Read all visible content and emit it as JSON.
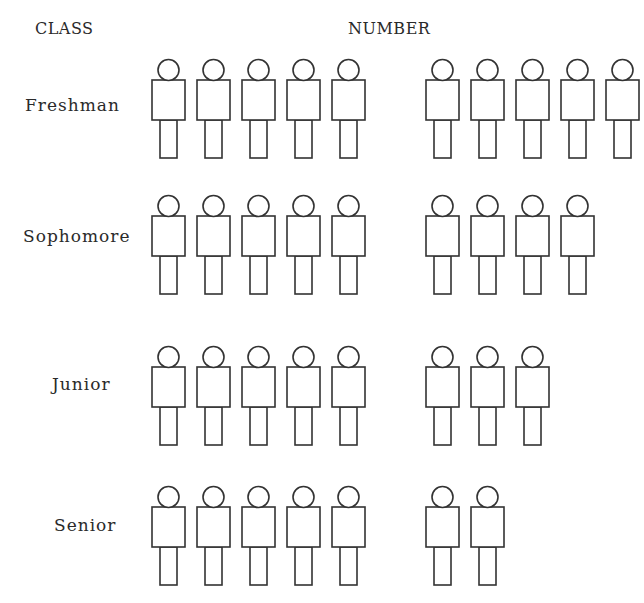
{
  "headers": {
    "class": "CLASS",
    "number": "NUMBER"
  },
  "rows": [
    {
      "label": "Freshman",
      "count": 10
    },
    {
      "label": "Sophomore",
      "count": 9
    },
    {
      "label": "Junior",
      "count": 8
    },
    {
      "label": "Senior",
      "count": 7
    }
  ],
  "chart_data": {
    "type": "pictograph",
    "title": "",
    "xlabel": "NUMBER",
    "ylabel": "CLASS",
    "categories": [
      "Freshman",
      "Sophomore",
      "Junior",
      "Senior"
    ],
    "values": [
      10,
      9,
      8,
      7
    ],
    "icon": "person-icon",
    "grouping": "icons grouped in sets of 5",
    "grid": false,
    "legend": null
  }
}
